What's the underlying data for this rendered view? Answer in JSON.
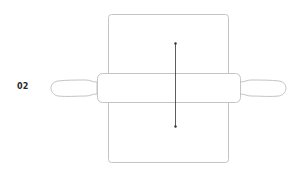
{
  "step": {
    "number": "02"
  },
  "illustration": {
    "subject": "rolling-pin-on-dough",
    "stroke_color": "#bdbdbd",
    "arrow_color": "#333333",
    "arrow_direction": "vertical-bidirectional"
  }
}
